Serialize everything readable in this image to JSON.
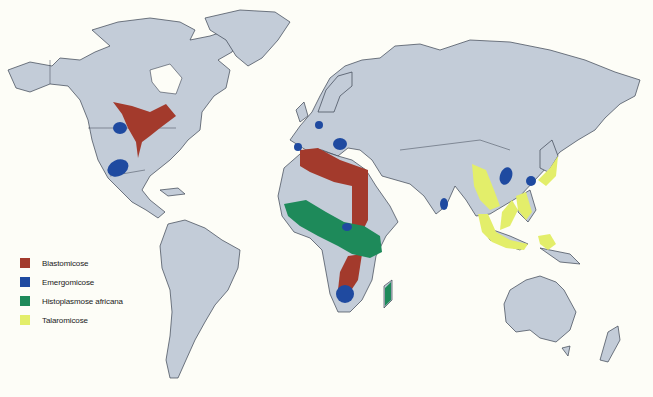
{
  "map": {
    "type": "world-distribution-map",
    "colors": {
      "background": "#fdfdf7",
      "land": "#c3ccd8",
      "border": "#3a4250"
    }
  },
  "legend": {
    "items": [
      {
        "label": "Blastomicose",
        "color": "#a33a2c"
      },
      {
        "label": "Emergomicose",
        "color": "#1f4aa0"
      },
      {
        "label": "Histoplasmose africana",
        "color": "#1e8a5a"
      },
      {
        "label": "Talaromicose",
        "color": "#e3ee6a"
      }
    ]
  },
  "regions": {
    "blastomicose": [
      "North America (Great Lakes / Mississippi)",
      "North Africa to Middle East",
      "Southern Africa"
    ],
    "emergomicose": [
      "North America (west)",
      "North America (southwest)",
      "Europe (central)",
      "Europe (Balkans)",
      "Iberia",
      "Central Africa",
      "Southern Africa",
      "India",
      "China",
      "Korea"
    ],
    "histoplasmose_africana": [
      "West-Central Africa",
      "Madagascar"
    ],
    "talaromicose": [
      "Southeast Asia",
      "Southern China",
      "Philippines",
      "Japan",
      "Indonesia"
    ]
  }
}
